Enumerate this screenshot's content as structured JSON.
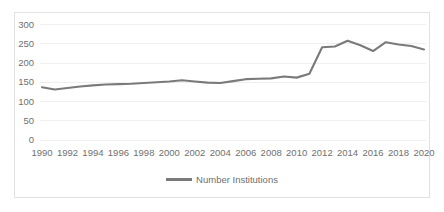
{
  "chart_data": {
    "type": "line",
    "title": "",
    "subtitle": "",
    "xlabel": "",
    "ylabel": "",
    "x": [
      1990,
      1991,
      1992,
      1993,
      1994,
      1995,
      1996,
      1997,
      1998,
      1999,
      2000,
      2001,
      2002,
      2003,
      2004,
      2005,
      2006,
      2007,
      2008,
      2009,
      2010,
      2011,
      2012,
      2013,
      2014,
      2015,
      2016,
      2017,
      2018,
      2019,
      2020
    ],
    "series": [
      {
        "name": "Number Institutions",
        "color": "#7a7a7a",
        "values": [
          137,
          131,
          135,
          139,
          142,
          144,
          145,
          146,
          148,
          150,
          152,
          155,
          152,
          149,
          148,
          153,
          158,
          159,
          160,
          165,
          162,
          172,
          241,
          243,
          258,
          246,
          231,
          254,
          248,
          244,
          235
        ]
      }
    ],
    "xticks": [
      1990,
      1992,
      1994,
      1996,
      1998,
      2000,
      2002,
      2004,
      2006,
      2008,
      2010,
      2012,
      2014,
      2016,
      2018,
      2020
    ],
    "xtick_labels": [
      "1990",
      "1992",
      "1994",
      "1996",
      "1998",
      "2000",
      "2002",
      "2004",
      "2006",
      "2008",
      "2010",
      "2012",
      "2014",
      "2016",
      "2018",
      "2020"
    ],
    "yticks": [
      0,
      50,
      100,
      150,
      200,
      250,
      300
    ],
    "ytick_labels": [
      "0",
      "50",
      "100",
      "150",
      "200",
      "250",
      "300"
    ],
    "ylim": [
      0,
      300
    ],
    "xlim": [
      1990,
      2020
    ],
    "grid": "horizontal",
    "grid_color": "#efefef",
    "legend": {
      "position": "bottom",
      "entries": [
        {
          "label": "Number Institutions",
          "color": "#7a7a7a"
        }
      ]
    },
    "plot_border_color": "#e2e2e2",
    "tick_text_color": "#6f6f6f",
    "background": "#ffffff"
  }
}
